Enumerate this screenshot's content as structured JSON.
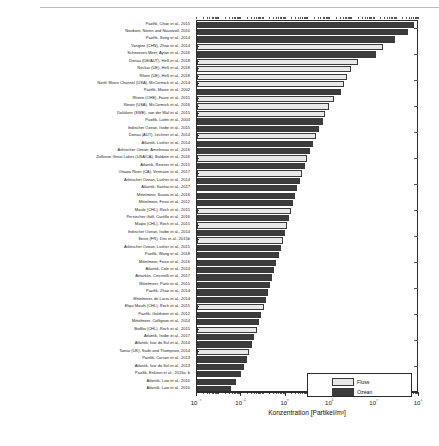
{
  "chart_data": {
    "type": "bar",
    "orientation": "horizontal",
    "title": "",
    "xlabel": "Konzentration [Partikel/m³]",
    "ylabel": "",
    "xscale": "log",
    "xlim": [
      0.0001,
      1000000
    ],
    "xticks": [
      "10⁻⁴",
      "10⁻²",
      "10⁰",
      "10²",
      "10⁴",
      "10⁶"
    ],
    "xtick_values": [
      0.0001,
      0.01,
      1,
      100,
      10000,
      1000000
    ],
    "grid": false,
    "legend_position": "bottom-right",
    "legend": [
      {
        "name": "Fluss",
        "color": "#e8e8e8"
      },
      {
        "name": "Ozean",
        "color": "#3c3c3c"
      }
    ],
    "categories": [
      "Pazifik, Chae et al., 2015",
      "Nordsee, Noren and Naustvoll, 2010",
      "Pazifik, Song et al., 2014",
      "Yangtze (CHN), Zhao et al., 2014",
      "Schwarzes Meer, Aytan et al., 2016",
      "Donau (DE/AUT), Heß et al., 2018",
      "Neckar (DE), Heß et al., 2018",
      "Rhein (DE), Heß et al., 2018",
      "North Shore Channel (USA), McCormick et al., 2014",
      "Pazifik, Moore et al., 2002",
      "Rhone (CHE), Faure et al., 2015",
      "Illinois (USA), McCormick et al., 2016",
      "Dalälven (SWE), van der Wal et al., 2015",
      "Pazifik, Lattin et al., 2004",
      "Indischer Ozean, Isobe et al., 2015",
      "Donau (AUT), Lechner et al., 2014",
      "Atlantik, Lusher et al., 2014",
      "Arktischer Ozean, Amelineau et al., 2016",
      "Zuflüsse Great Lakes (USA/CA), Baldwin et al., 2016",
      "Atlantik, Reisser et al., 2015",
      "Ottawa River (CA), Vermaire et al., 2017",
      "Arktischer Ozean, Lusher et al., 2014",
      "Atlantik, Kanhai et al., 2017",
      "Mittelmeer, Suaria et al., 2016",
      "Mittelmeer, Fossi et al., 2012",
      "Maule (CHL), Rech et al., 2015",
      "Persischer Golf, Castillo et al., 2016",
      "Maipo (CHL), Rech et al., 2015",
      "Indischer Ozean, Isobe et al., 2014",
      "Seine (FR), Dris et al., 2015b",
      "Arktischer Ozean, Lusher et al., 2015",
      "Pazifik, Wang et al., 2018",
      "Mittelmeer, Fossi et al., 2016",
      "Atlantik, Cole et al., 2014",
      "Antarktis, Cincinelli et al., 2017",
      "Mittelmeer, Panti et al., 2015",
      "Pazifik, Zhao et al., 2014",
      "Mittelmeer, de Lucia et al., 2014",
      "Elqui Mouth (CHL), Rech et al., 2015",
      "Pazifik, Goldstein et al., 2012",
      "Mittelmeer, Collignon et al., 2014",
      "BioBio (CHL), Rech et al., 2015",
      "Atlantik, Isobe et al., 2017",
      "Atlantik, Ivar do Sul et al., 2014",
      "Tamar (UK), Sadri and Thompson, 2014",
      "Pazifik, Carson et al., 2013",
      "Atlantik, Ivar do Sul et al., 2013",
      "Pazifik, Eriksen et al., 2013a, b",
      "Atlantik, Law et al., 2010",
      "Atlantik, Law et al., 2010"
    ],
    "series_labels": [
      "Ozean",
      "Ozean",
      "Ozean",
      "Fluss",
      "Ozean",
      "Fluss",
      "Fluss",
      "Fluss",
      "Fluss",
      "Ozean",
      "Fluss",
      "Fluss",
      "Fluss",
      "Ozean",
      "Ozean",
      "Fluss",
      "Ozean",
      "Ozean",
      "Fluss",
      "Ozean",
      "Fluss",
      "Ozean",
      "Ozean",
      "Ozean",
      "Ozean",
      "Fluss",
      "Ozean",
      "Fluss",
      "Ozean",
      "Fluss",
      "Ozean",
      "Ozean",
      "Ozean",
      "Ozean",
      "Ozean",
      "Ozean",
      "Ozean",
      "Ozean",
      "Fluss",
      "Ozean",
      "Ozean",
      "Fluss",
      "Ozean",
      "Ozean",
      "Fluss",
      "Ozean",
      "Ozean",
      "Ozean",
      "Ozean",
      "Ozean"
    ],
    "values": [
      620000,
      310000,
      80000,
      25000,
      12000,
      1800,
      900,
      600,
      400,
      300,
      150,
      90,
      60,
      45,
      30,
      22,
      16,
      12,
      9,
      7,
      5.5,
      4.2,
      3.3,
      2.6,
      2.1,
      1.7,
      1.35,
      1.1,
      0.9,
      0.72,
      0.58,
      0.47,
      0.38,
      0.3,
      0.25,
      0.2,
      0.16,
      0.125,
      0.1,
      0.08,
      0.062,
      0.05,
      0.038,
      0.03,
      0.023,
      0.017,
      0.013,
      0.0095,
      0.006,
      0.0035
    ]
  },
  "axis": {
    "xtitle": "Konzentration [Partikel/m³]"
  },
  "legend": {
    "items": [
      {
        "label": "Fluss"
      },
      {
        "label": "Ozean"
      }
    ]
  }
}
